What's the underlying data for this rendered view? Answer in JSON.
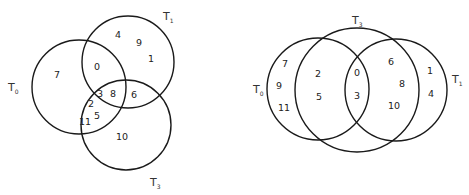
{
  "diagrams": [
    {
      "name": "left-venn",
      "sets": [
        {
          "label": "T",
          "sub": "0",
          "cx": 79,
          "cy": 87,
          "r": 47,
          "lx": 8,
          "ly": 91
        },
        {
          "label": "T",
          "sub": "1",
          "cx": 128,
          "cy": 62,
          "r": 46,
          "lx": 163,
          "ly": 20
        },
        {
          "label": "T",
          "sub": "3",
          "cx": 126,
          "cy": 125,
          "r": 45,
          "lx": 150,
          "ly": 186
        }
      ],
      "numbers": [
        {
          "v": "7",
          "x": 57,
          "y": 75
        },
        {
          "v": "4",
          "x": 118,
          "y": 35
        },
        {
          "v": "9",
          "x": 139,
          "y": 43
        },
        {
          "v": "1",
          "x": 151,
          "y": 59
        },
        {
          "v": "0",
          "x": 97,
          "y": 67
        },
        {
          "v": "3",
          "x": 100,
          "y": 94
        },
        {
          "v": "8",
          "x": 113,
          "y": 94
        },
        {
          "v": "6",
          "x": 134,
          "y": 95
        },
        {
          "v": "2",
          "x": 91,
          "y": 104
        },
        {
          "v": "5",
          "x": 97,
          "y": 116
        },
        {
          "v": "11",
          "x": 85,
          "y": 122
        },
        {
          "v": "10",
          "x": 122,
          "y": 137
        }
      ]
    },
    {
      "name": "right-venn",
      "sets": [
        {
          "label": "T",
          "sub": "0",
          "cx": 318,
          "cy": 89,
          "r": 51,
          "lx": 253,
          "ly": 93
        },
        {
          "label": "T",
          "sub": "3",
          "cx": 357,
          "cy": 90,
          "r": 62,
          "lx": 352,
          "ly": 24
        },
        {
          "label": "T",
          "sub": "1",
          "cx": 396,
          "cy": 90,
          "r": 51,
          "lx": 452,
          "ly": 83
        }
      ],
      "numbers": [
        {
          "v": "7",
          "x": 285,
          "y": 64
        },
        {
          "v": "9",
          "x": 279,
          "y": 86
        },
        {
          "v": "11",
          "x": 284,
          "y": 108
        },
        {
          "v": "2",
          "x": 318,
          "y": 74
        },
        {
          "v": "5",
          "x": 319,
          "y": 97
        },
        {
          "v": "0",
          "x": 357,
          "y": 73
        },
        {
          "v": "3",
          "x": 357,
          "y": 96
        },
        {
          "v": "6",
          "x": 391,
          "y": 62
        },
        {
          "v": "8",
          "x": 402,
          "y": 84
        },
        {
          "v": "10",
          "x": 394,
          "y": 106
        },
        {
          "v": "1",
          "x": 430,
          "y": 71
        },
        {
          "v": "4",
          "x": 431,
          "y": 94
        }
      ]
    }
  ]
}
